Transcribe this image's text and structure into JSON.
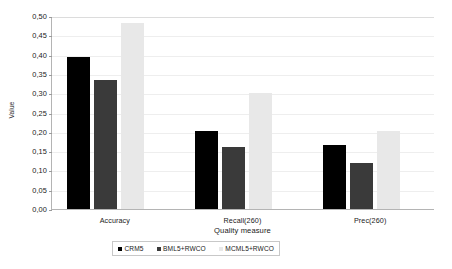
{
  "chart_data": {
    "type": "bar",
    "title": "",
    "xlabel": "Quality measure",
    "ylabel": "Value",
    "categories": [
      "Accuracy",
      "Recall(260)",
      "Prec(260)"
    ],
    "series": [
      {
        "name": "CRM5",
        "color": "#000000",
        "values": [
          0.395,
          0.202,
          0.166
        ]
      },
      {
        "name": "BML5+RWCO",
        "color": "#3a3a3a",
        "values": [
          0.335,
          0.16,
          0.119
        ]
      },
      {
        "name": "MCML5+RWCO",
        "color": "#e8e8e8",
        "values": [
          0.481,
          0.301,
          0.202
        ]
      }
    ],
    "ylim": [
      0.0,
      0.5
    ],
    "ytick_labels": [
      "0,00",
      "0,05",
      "0,10",
      "0,15",
      "0,20",
      "0,25",
      "0,30",
      "0,35",
      "0,40",
      "0,45",
      "0,50"
    ],
    "ytick_values": [
      0.0,
      0.05,
      0.1,
      0.15,
      0.2,
      0.25,
      0.3,
      0.35,
      0.4,
      0.45,
      0.5
    ],
    "grid": true,
    "legend_position": "bottom",
    "decimal_separator": ","
  }
}
